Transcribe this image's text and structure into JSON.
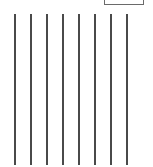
{
  "diagram": {
    "type": "parallel-lines",
    "line_color": "#4a4a4a",
    "box": {
      "label": ""
    },
    "lines": [
      {
        "x": 14,
        "top_label": "",
        "bottom_label": ""
      },
      {
        "x": 30,
        "top_label": "",
        "bottom_label": ""
      },
      {
        "x": 46,
        "top_label": "",
        "bottom_label": ""
      },
      {
        "x": 62,
        "top_label": "",
        "bottom_label": ""
      },
      {
        "x": 78,
        "top_label": "",
        "bottom_label": ""
      },
      {
        "x": 94,
        "top_label": "",
        "bottom_label": ""
      },
      {
        "x": 110,
        "top_label": "",
        "bottom_label": ""
      },
      {
        "x": 126,
        "top_label": "",
        "bottom_label": ""
      }
    ]
  }
}
